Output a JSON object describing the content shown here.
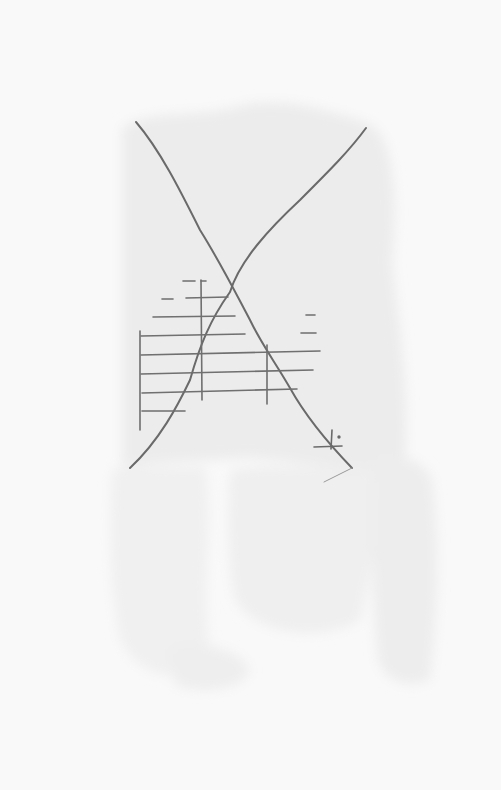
{
  "artwork": {
    "medium": "pencil on paper",
    "colors": {
      "paper": "#f9f9f9",
      "wash": "#ececec",
      "wash_light": "#f1f1f1",
      "pencil": "#6a6a6a",
      "pencil_light": "#8c8c8c"
    },
    "elements": [
      "large-x-curves",
      "horizontal-line-grid",
      "vertical-tick-lines",
      "small-cross-mark"
    ]
  }
}
